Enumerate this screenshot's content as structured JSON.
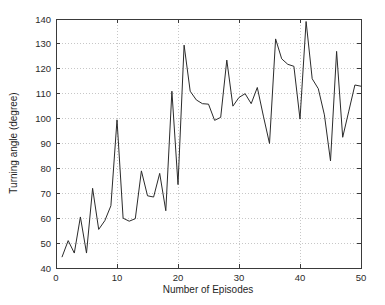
{
  "chart_data": {
    "type": "line",
    "title": "",
    "xlabel": "Number of Episodes",
    "ylabel": "Turning angle (degree)",
    "xlim": [
      0,
      50
    ],
    "ylim": [
      40,
      140
    ],
    "xticks": [
      0,
      10,
      20,
      30,
      40,
      50
    ],
    "yticks": [
      40,
      50,
      60,
      70,
      80,
      90,
      100,
      110,
      120,
      130,
      140
    ],
    "grid": true,
    "legend": null,
    "line_color": "#2b2b2b",
    "series": [
      {
        "name": "turning angle",
        "x": [
          1,
          2,
          3,
          4,
          5,
          6,
          7,
          8,
          9,
          10,
          11,
          12,
          13,
          14,
          15,
          16,
          17,
          18,
          19,
          20,
          21,
          22,
          23,
          24,
          25,
          26,
          27,
          28,
          29,
          30,
          31,
          32,
          33,
          34,
          35,
          36,
          37,
          38,
          39,
          40,
          41,
          42,
          43,
          44,
          45,
          46,
          47,
          48,
          49,
          50
        ],
        "values": [
          44.5,
          51.0,
          46.0,
          60.5,
          46.0,
          72.0,
          55.5,
          59.0,
          65.0,
          99.5,
          60.0,
          58.8,
          59.8,
          79.0,
          69.0,
          68.5,
          78.0,
          63.0,
          111.0,
          73.5,
          129.5,
          111.0,
          107.5,
          106.0,
          105.8,
          99.3,
          100.5,
          123.5,
          105.0,
          108.5,
          110.0,
          106.0,
          112.5,
          101.0,
          90.0,
          132.0,
          124.0,
          121.8,
          121.0,
          99.8,
          139.0,
          116.0,
          112.0,
          101.5,
          83.0,
          127.0,
          92.5,
          103.0,
          113.5,
          113.0
        ]
      }
    ]
  },
  "axes": {
    "x_tick_labels": [
      "0",
      "10",
      "20",
      "30",
      "40",
      "50"
    ],
    "y_tick_labels": [
      "40",
      "50",
      "60",
      "70",
      "80",
      "90",
      "100",
      "110",
      "120",
      "130",
      "140"
    ]
  }
}
